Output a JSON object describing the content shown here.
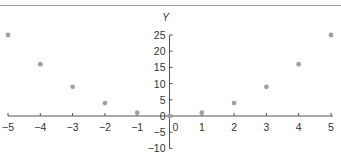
{
  "header": {
    "cut_off_caption": "..."
  },
  "chart_data": {
    "type": "scatter",
    "title": "",
    "xlabel": "",
    "ylabel": "Y",
    "x": [
      -5,
      -4,
      -3,
      -2,
      -1,
      0,
      1,
      2,
      3,
      4,
      5
    ],
    "series": [
      {
        "name": "y = x^2",
        "values": [
          25,
          16,
          9,
          4,
          1,
          0,
          1,
          4,
          9,
          16,
          25
        ]
      }
    ],
    "xlim": [
      -5,
      5
    ],
    "ylim": [
      -10,
      25
    ],
    "x_ticks": [
      -5,
      -4,
      -3,
      -2,
      -1,
      0,
      1,
      2,
      3,
      4,
      5
    ],
    "y_ticks": [
      -10,
      -5,
      0,
      5,
      10,
      15,
      20,
      25
    ],
    "grid": false,
    "legend": "none",
    "marker_color": "#a0a0a0",
    "axis_color": "#555555"
  }
}
